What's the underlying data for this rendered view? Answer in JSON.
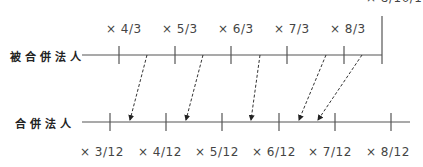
{
  "diagram": {
    "top_row": {
      "label": "被合併法人",
      "tick_labels": [
        "× 4/3",
        "× 5/3",
        "× 6/3",
        "× 7/3",
        "× 8/3"
      ],
      "end_label": "× 8/10/1"
    },
    "bottom_row": {
      "label": "合併法人",
      "tick_labels": [
        "× 3/12",
        "× 4/12",
        "× 5/12",
        "× 6/12",
        "× 7/12",
        "× 8/12"
      ]
    },
    "colors": {
      "line": "#555555",
      "arrow": "#333333",
      "text": "#444444"
    }
  }
}
